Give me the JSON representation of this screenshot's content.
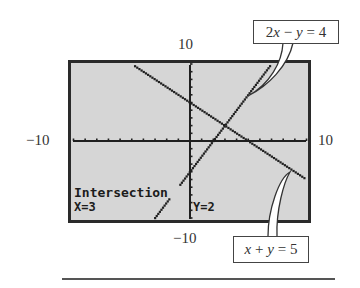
{
  "chart_data": {
    "type": "line",
    "title": "",
    "window": {
      "xmin": -10,
      "xmax": 10,
      "ymin": -10,
      "ymax": 10
    },
    "axis_labels": {
      "top": "10",
      "bottom": "−10",
      "left": "−10",
      "right": "10"
    },
    "xlabel": "",
    "ylabel": "",
    "grid": false,
    "ticks": {
      "x_step": 1,
      "y_step": 1
    },
    "series": [
      {
        "name": "x + y = 5",
        "equation": "y = 5 - x",
        "slope": -1,
        "intercept": 5,
        "points": [
          [
            -6.4,
            11.4
          ],
          [
            10,
            -5
          ]
        ]
      },
      {
        "name": "2x − y = 4",
        "equation": "y = 2x - 4",
        "slope": 2,
        "intercept": -4,
        "points": [
          [
            -3,
            -10
          ],
          [
            7,
            10
          ]
        ]
      }
    ],
    "intersection": {
      "x": 3,
      "y": 2
    },
    "annotations": [
      "Intersection",
      "X=3",
      "Y=2",
      "2x − y = 4",
      "x + y = 5"
    ]
  },
  "labels": {
    "top": "10",
    "bottom": "−10",
    "left": "−10",
    "right": "10"
  },
  "callouts": {
    "line1": {
      "pre": "2",
      "var1": "x",
      "op": " − ",
      "var2": "y",
      "post": " = 4"
    },
    "line2": {
      "var1": "x",
      "op": " + ",
      "var2": "y",
      "post": " = 5"
    }
  },
  "screen": {
    "title": "Intersection",
    "x_readout": "X=3",
    "y_readout": "Y=2",
    "bg_color": "#d6d6d6",
    "ink_color": "#1f1f1f"
  }
}
